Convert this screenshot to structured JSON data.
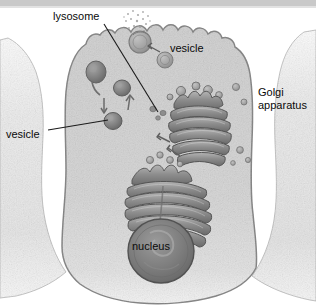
{
  "figure": {
    "type": "cell-biology-diagram",
    "background_color": "#ffffff",
    "top_band_color": "#c9c9c9",
    "cytoplasm_color": "#d6d6d6",
    "membrane_color": "#8a8a8a",
    "organelle_color": "#9a9a9a",
    "organelle_dark_color": "#6e6e6e",
    "nucleus_color": "#7c7c7c",
    "neighbor_cell_color": "#e8e8e8",
    "label_color": "#0a0a0a",
    "leader_line_color": "#1a1a1a"
  },
  "labels": [
    {
      "id": "lysosome",
      "text": "lysosome",
      "leader": true
    },
    {
      "id": "vesicle_top",
      "text": "vesicle",
      "leader": false
    },
    {
      "id": "vesicle_left",
      "text": "vesicle",
      "leader": true
    },
    {
      "id": "golgi_line1",
      "text": "Golgi",
      "leader": false
    },
    {
      "id": "golgi_line2",
      "text": "apparatus",
      "leader": false
    },
    {
      "id": "nucleus",
      "text": "nucleus",
      "leader": false
    }
  ],
  "structures": {
    "cell": "central secretory cell in cross-section with ruffled apical membrane",
    "neighbor_left": "partial adjacent cell at left edge",
    "neighbor_right": "partial adjacent cell at right edge",
    "golgi_upper": "stack of curved cisternae, right of centre",
    "golgi_lower": "stack of curved cisternae wrapping over the nucleus",
    "nucleus": "large dark sphere at lower centre with nucleolus",
    "secretion": "dotted granules released at the apical surface by exocytosis",
    "vesicle_count_visible": 14,
    "arrow_count_visible": 5
  }
}
